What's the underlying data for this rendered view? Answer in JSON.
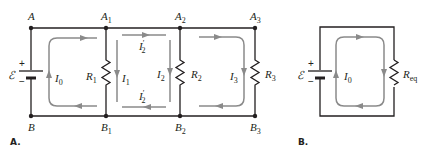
{
  "diagram": {
    "type": "circuit-schematic",
    "panels": [
      {
        "label": "A.",
        "description": "Battery with three parallel resistors and current loops",
        "nodes_top": [
          "A",
          "A1",
          "A2",
          "A3"
        ],
        "nodes_bottom": [
          "B",
          "B1",
          "B2",
          "B3"
        ],
        "source": {
          "symbol": "ℰ",
          "plus": "+",
          "minus": "−"
        },
        "resistors": [
          "R1",
          "R2",
          "R3"
        ],
        "currents": [
          "I0",
          "I1",
          "I2'",
          "I2'",
          "I2",
          "I3"
        ]
      },
      {
        "label": "B.",
        "description": "Equivalent circuit with single resistor",
        "source": {
          "symbol": "ℰ",
          "plus": "+",
          "minus": "−"
        },
        "resistors": [
          "Req"
        ],
        "currents": [
          "I0"
        ]
      }
    ]
  },
  "labels": {
    "A": "A",
    "A1": "A",
    "A1_sub": "1",
    "A2": "A",
    "A2_sub": "2",
    "A3": "A",
    "A3_sub": "3",
    "B": "B",
    "B1": "B",
    "B1_sub": "1",
    "B2": "B",
    "B2_sub": "2",
    "B3": "B",
    "B3_sub": "3",
    "emf": "ℰ",
    "plus": "+",
    "minus": "−",
    "R": "R",
    "R1_sub": "1",
    "R2_sub": "2",
    "R3_sub": "3",
    "Req_sub": "eq",
    "I": "I",
    "I0_sub": "0",
    "I1_sub": "1",
    "I2_sub": "2",
    "I3_sub": "3",
    "prime": "′",
    "panel_a": "A.",
    "panel_b": "B."
  },
  "colors": {
    "wire": "#231f20",
    "current": "#8a8a8a",
    "background": "#ffffff"
  }
}
